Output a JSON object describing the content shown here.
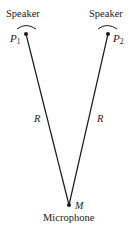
{
  "diagram": {
    "speaker_left": {
      "label": "Speaker",
      "point_label": "P",
      "point_subscript": "1"
    },
    "speaker_right": {
      "label": "Speaker",
      "point_label": "P",
      "point_subscript": "2"
    },
    "microphone": {
      "label": "Microphone",
      "point_label": "M"
    },
    "distance_left": "R",
    "distance_right": "R",
    "colors": {
      "stroke": "#1a1a1a",
      "background": "#ffffff"
    }
  }
}
